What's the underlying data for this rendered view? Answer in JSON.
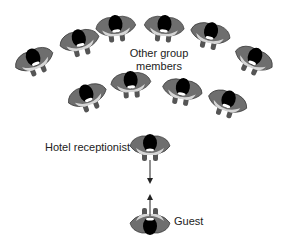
{
  "labels": {
    "group": [
      "Other group",
      "members"
    ],
    "receptionist": "Hotel receptionist",
    "guest": "Guest"
  },
  "colors": {
    "body_dark": "#6e6e6e",
    "body_light": "#d6d6d6",
    "head": "#000000",
    "outline": "#333333"
  },
  "figures": [
    {
      "role": "group-member",
      "x": 35,
      "y": 62,
      "rot": -22
    },
    {
      "role": "group-member",
      "x": 80,
      "y": 43,
      "rot": -14
    },
    {
      "role": "group-member",
      "x": 116,
      "y": 29,
      "rot": -6
    },
    {
      "role": "group-member",
      "x": 164,
      "y": 29,
      "rot": 6
    },
    {
      "role": "group-member",
      "x": 210,
      "y": 36,
      "rot": 12
    },
    {
      "role": "group-member",
      "x": 253,
      "y": 61,
      "rot": 24
    },
    {
      "role": "group-member",
      "x": 88,
      "y": 98,
      "rot": -20
    },
    {
      "role": "group-member",
      "x": 131,
      "y": 85,
      "rot": -4
    },
    {
      "role": "group-member",
      "x": 182,
      "y": 92,
      "rot": 10
    },
    {
      "role": "group-member",
      "x": 227,
      "y": 104,
      "rot": 18
    },
    {
      "role": "hotel-receptionist",
      "x": 150,
      "y": 148,
      "rot": 0
    },
    {
      "role": "guest",
      "x": 150,
      "y": 221,
      "rot": 180
    }
  ]
}
